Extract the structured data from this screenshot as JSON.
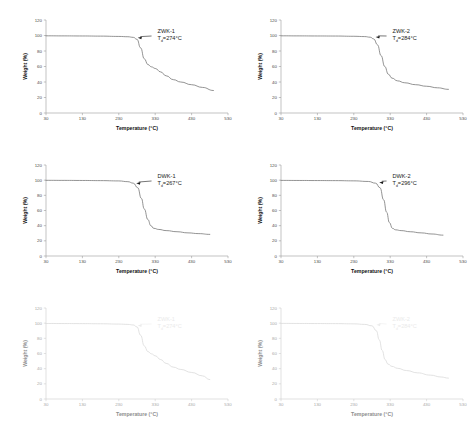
{
  "figure": {
    "panel_count": 6,
    "columns": 2,
    "rows": 3,
    "background": "#ffffff",
    "curve_color": "#6f6f6f",
    "curve_color_faded": "#d8d8d8",
    "axis_color": "#9a9a9a",
    "text_color": "#1a1a1a"
  },
  "axes_common": {
    "xlabel": "Temperature (°C)",
    "ylabel": "Weight (%)",
    "xticks": [
      "30",
      "130",
      "230",
      "330",
      "430",
      "530"
    ],
    "yticks": [
      "0",
      "20",
      "40",
      "60",
      "80",
      "100",
      "120"
    ],
    "xlim": [
      30,
      530
    ],
    "ylim": [
      0,
      120
    ],
    "grid": "off"
  },
  "chart_data": [
    {
      "id": "panel-zwk-1",
      "type": "line",
      "title": "",
      "sample_label": "ZWK-1",
      "td_label": "Tₔ=274°C",
      "td_prefix": "T",
      "td_sub": "d",
      "td_suffix": "=274°C",
      "td_value": 274,
      "xlabel": "Temperature (°C)",
      "ylabel": "Weight (%)",
      "xticks": [
        "30",
        "130",
        "230",
        "330",
        "430",
        "530"
      ],
      "yticks": [
        "0",
        "20",
        "40",
        "60",
        "80",
        "100",
        "120"
      ],
      "xlim": [
        30,
        530
      ],
      "ylim": [
        0,
        120
      ],
      "faded": false,
      "arrow_point": [
        282,
        97
      ],
      "x": [
        30,
        80,
        130,
        180,
        230,
        255,
        270,
        280,
        290,
        300,
        310,
        320,
        330,
        345,
        360,
        380,
        400,
        430,
        460,
        490
      ],
      "y": [
        99.6,
        99.5,
        99.4,
        99.2,
        98.8,
        98.4,
        97.6,
        95.0,
        84.0,
        70.0,
        62.5,
        59.5,
        57.5,
        53.0,
        48.0,
        43.0,
        40.0,
        36.5,
        33.0,
        29.0
      ]
    },
    {
      "id": "panel-zwk-2",
      "type": "line",
      "title": "",
      "sample_label": "ZWK-2",
      "td_label": "Tₔ=284°C",
      "td_prefix": "T",
      "td_sub": "d",
      "td_suffix": "=284°C",
      "td_value": 284,
      "xlabel": "Temperature (°C)",
      "ylabel": "Weight (%)",
      "xticks": [
        "30",
        "130",
        "230",
        "330",
        "430",
        "530"
      ],
      "yticks": [
        "0",
        "20",
        "40",
        "60",
        "80",
        "100",
        "120"
      ],
      "xlim": [
        30,
        530
      ],
      "ylim": [
        0,
        120
      ],
      "faded": false,
      "arrow_point": [
        290,
        98
      ],
      "x": [
        30,
        80,
        130,
        180,
        230,
        260,
        275,
        285,
        295,
        305,
        315,
        325,
        335,
        350,
        370,
        400,
        430,
        460,
        490
      ],
      "y": [
        99.6,
        99.5,
        99.4,
        99.3,
        99.0,
        98.6,
        97.8,
        95.5,
        88.0,
        74.0,
        60.0,
        50.0,
        45.0,
        41.5,
        39.0,
        36.5,
        34.5,
        32.5,
        30.5
      ]
    },
    {
      "id": "panel-dwk-1",
      "type": "line",
      "title": "",
      "sample_label": "DWK-1",
      "td_label": "Tₔ=267°C",
      "td_prefix": "T",
      "td_sub": "d",
      "td_suffix": "=267°C",
      "td_value": 267,
      "xlabel": "Temperature (°C)",
      "ylabel": "Weight (%)",
      "xticks": [
        "30",
        "130",
        "230",
        "330",
        "430",
        "530"
      ],
      "yticks": [
        "0",
        "20",
        "40",
        "60",
        "80",
        "100",
        "120"
      ],
      "xlim": [
        30,
        530
      ],
      "ylim": [
        0,
        120
      ],
      "faded": false,
      "arrow_point": [
        278,
        96
      ],
      "x": [
        30,
        80,
        130,
        180,
        230,
        255,
        270,
        282,
        292,
        300,
        310,
        318,
        326,
        340,
        360,
        390,
        420,
        450,
        480
      ],
      "y": [
        99.8,
        99.7,
        99.6,
        99.4,
        99.0,
        98.0,
        96.0,
        90.0,
        76.0,
        62.0,
        48.0,
        40.0,
        36.5,
        35.0,
        33.5,
        32.0,
        30.5,
        29.5,
        28.5
      ]
    },
    {
      "id": "panel-dwk-2",
      "type": "line",
      "title": "",
      "sample_label": "DWK-2",
      "td_label": "Tₔ=296°C",
      "td_prefix": "T",
      "td_sub": "d",
      "td_suffix": "=296°C",
      "td_value": 296,
      "xlabel": "Temperature (°C)",
      "ylabel": "Weight (%)",
      "xticks": [
        "30",
        "130",
        "230",
        "330",
        "430",
        "530"
      ],
      "yticks": [
        "0",
        "20",
        "40",
        "60",
        "80",
        "100",
        "120"
      ],
      "xlim": [
        30,
        530
      ],
      "ylim": [
        0,
        120
      ],
      "faded": false,
      "arrow_point": [
        300,
        97
      ],
      "x": [
        30,
        80,
        130,
        180,
        230,
        270,
        290,
        302,
        312,
        320,
        328,
        336,
        345,
        360,
        385,
        415,
        445,
        475
      ],
      "y": [
        99.7,
        99.6,
        99.5,
        99.4,
        99.1,
        98.3,
        96.0,
        90.0,
        74.0,
        58.0,
        44.0,
        36.5,
        34.5,
        33.5,
        32.0,
        30.5,
        29.0,
        27.5
      ]
    },
    {
      "id": "panel-zwk-1-faded",
      "type": "line",
      "title": "",
      "sample_label": "ZWK-1",
      "td_label": "Tₔ=274°C",
      "td_prefix": "T",
      "td_sub": "d",
      "td_suffix": "=274°C",
      "td_value": 274,
      "xlabel": "Temperature (°C)",
      "ylabel": "Weight (%)",
      "xticks": [
        "30",
        "130",
        "230",
        "330",
        "430",
        "530"
      ],
      "yticks": [
        "0",
        "20",
        "40",
        "60",
        "80",
        "100",
        "120"
      ],
      "xlim": [
        30,
        530
      ],
      "ylim": [
        0,
        120
      ],
      "faded": true,
      "arrow_point": [
        282,
        97
      ],
      "x": [
        30,
        80,
        130,
        180,
        230,
        255,
        270,
        280,
        290,
        300,
        310,
        320,
        330,
        345,
        360,
        380,
        400,
        430,
        460,
        480
      ],
      "y": [
        99.6,
        99.5,
        99.4,
        99.2,
        98.8,
        98.4,
        97.6,
        95.0,
        84.0,
        70.0,
        62.5,
        59.5,
        57.0,
        52.0,
        47.0,
        42.0,
        39.0,
        35.0,
        30.5,
        25.5
      ]
    },
    {
      "id": "panel-zwk-2-faded",
      "type": "line",
      "title": "",
      "sample_label": "ZWK-2",
      "td_label": "Tₔ=284°C",
      "td_prefix": "T",
      "td_sub": "d",
      "td_suffix": "=284°C",
      "td_value": 284,
      "xlabel": "Temperature (°C)",
      "ylabel": "Weight (%)",
      "xticks": [
        "30",
        "130",
        "230",
        "330",
        "430",
        "530"
      ],
      "yticks": [
        "0",
        "20",
        "40",
        "60",
        "80",
        "100",
        "120"
      ],
      "xlim": [
        30,
        530
      ],
      "ylim": [
        0,
        120
      ],
      "faded": true,
      "arrow_point": [
        292,
        98
      ],
      "x": [
        30,
        80,
        130,
        180,
        230,
        260,
        280,
        292,
        300,
        308,
        316,
        324,
        335,
        350,
        375,
        405,
        440,
        470,
        490
      ],
      "y": [
        99.7,
        99.6,
        99.5,
        99.4,
        99.1,
        98.4,
        96.5,
        90.0,
        78.0,
        64.0,
        52.0,
        46.0,
        43.0,
        40.5,
        37.5,
        34.5,
        31.5,
        29.0,
        27.5
      ]
    }
  ]
}
